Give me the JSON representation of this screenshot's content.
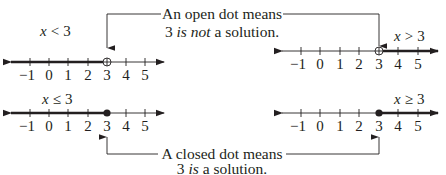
{
  "callouts": {
    "open": {
      "line1": "An open dot means",
      "line2_prefix": "3 ",
      "line2_italic": "is not",
      "line2_suffix": " a solution."
    },
    "closed": {
      "line1": "A closed dot means",
      "line2_prefix": "3 ",
      "line2_italic": "is",
      "line2_suffix": " a solution."
    }
  },
  "number_lines": [
    {
      "id": "lt",
      "variable": "x",
      "operator": "<",
      "value": "3",
      "dot": "open",
      "direction": "left"
    },
    {
      "id": "gt",
      "variable": "x",
      "operator": ">",
      "value": "3",
      "dot": "open",
      "direction": "right"
    },
    {
      "id": "le",
      "variable": "x",
      "operator": "≤",
      "value": "3",
      "dot": "closed",
      "direction": "left"
    },
    {
      "id": "ge",
      "variable": "x",
      "operator": "≥",
      "value": "3",
      "dot": "closed",
      "direction": "right"
    }
  ],
  "tick_labels": [
    "−1",
    "0",
    "1",
    "2",
    "3",
    "4",
    "5"
  ],
  "colors": {
    "ink": "#231f20",
    "background": "#ffffff"
  }
}
